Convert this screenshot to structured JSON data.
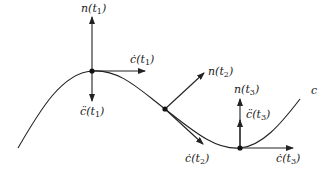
{
  "diagram": {
    "type": "curve-frenet-vectors",
    "curve_label": "c",
    "line_color": "#222222",
    "points": [
      {
        "id": "t1",
        "x": 92,
        "y": 71,
        "normal_label_fn": "n",
        "tangent_label_fn": "ċ",
        "accel_label_fn": "c̈",
        "param": "t",
        "sub": "1"
      },
      {
        "id": "t2",
        "x": 165,
        "y": 109,
        "normal_label_fn": "n",
        "tangent_label_fn": "ċ",
        "param": "t",
        "sub": "2"
      },
      {
        "id": "t3",
        "x": 240,
        "y": 148,
        "normal_label_fn": "n",
        "tangent_label_fn": "ċ",
        "accel_label_fn": "c̈",
        "param": "t",
        "sub": "3"
      }
    ]
  }
}
